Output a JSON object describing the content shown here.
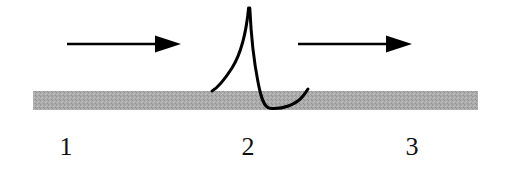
{
  "figure": {
    "background_color": "#ffffff",
    "width": 514,
    "height": 180
  },
  "surface": {
    "name": "gray-substrate-band",
    "fill_color": "#a9a9a9",
    "speckle_color": "#8c8c8c",
    "x": 33,
    "y": 91,
    "width": 445,
    "height": 19
  },
  "arrows": [
    {
      "name": "arrow-left",
      "label": "",
      "color": "#000000",
      "x_start": 67,
      "x_tip": 181,
      "y": 44,
      "shaft_thickness": 2.4,
      "head_length": 26,
      "head_width": 17
    },
    {
      "name": "arrow-right",
      "label": "",
      "color": "#000000",
      "x_start": 298,
      "x_tip": 412,
      "y": 44,
      "shaft_thickness": 2.4,
      "head_length": 26,
      "head_width": 17
    }
  ],
  "pulse": {
    "name": "soliton-pulse-curve",
    "color": "#000000",
    "stroke_width": 3,
    "peak_x": 249,
    "peak_y": 8,
    "left_tail_end_x": 212,
    "left_tail_end_y": 91,
    "trough_x": 269,
    "trough_y": 108,
    "right_tail_end_x": 308,
    "right_tail_end_y": 89
  },
  "labels": {
    "stage_1": "1",
    "stage_2": "2",
    "stage_3": "3"
  },
  "colors": {
    "ink": "#000000",
    "substrate": "#a9a9a9",
    "paper": "#ffffff"
  }
}
